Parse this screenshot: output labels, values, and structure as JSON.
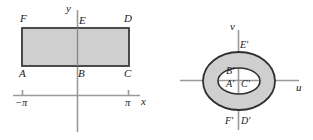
{
  "figure": {
    "kind": "math-diagram-pair",
    "background_color": "#ffffff",
    "stroke_color": "#3a3a3a",
    "axis_color": "#9a9a9a",
    "fill_color": "#cfcfcf",
    "label_color": "#1a1a1a"
  },
  "left_panel": {
    "name": "z-plane-rectangle",
    "axes": {
      "x_label": "x",
      "y_label": "y",
      "x_ticks": [
        {
          "label": "−π",
          "value": -3.14159
        },
        {
          "label": "π",
          "value": 3.14159
        }
      ]
    },
    "region": {
      "shape": "rectangle",
      "fill": "#cfcfcf",
      "vertices": [
        {
          "label": "A",
          "position": "bottom-left"
        },
        {
          "label": "B",
          "position": "bottom-center"
        },
        {
          "label": "C",
          "position": "bottom-right"
        },
        {
          "label": "D",
          "position": "top-right"
        },
        {
          "label": "E",
          "position": "top-center"
        },
        {
          "label": "F",
          "position": "top-left"
        }
      ]
    }
  },
  "right_panel": {
    "name": "w-plane-annulus",
    "axes": {
      "u_label": "u",
      "v_label": "v",
      "u_ticks": [],
      "v_ticks": []
    },
    "region": {
      "shape": "annulus",
      "fill": "#cfcfcf",
      "outer": "outer-ellipse",
      "inner": "inner-ellipse",
      "vertices": [
        {
          "label": "A′",
          "position": "inner-left-bottom"
        },
        {
          "label": "B′",
          "position": "inner-top"
        },
        {
          "label": "C′",
          "position": "inner-right-bottom"
        },
        {
          "label": "D′",
          "position": "outer-bottom-right"
        },
        {
          "label": "E′",
          "position": "outer-top"
        },
        {
          "label": "F′",
          "position": "outer-bottom-left"
        }
      ]
    }
  }
}
